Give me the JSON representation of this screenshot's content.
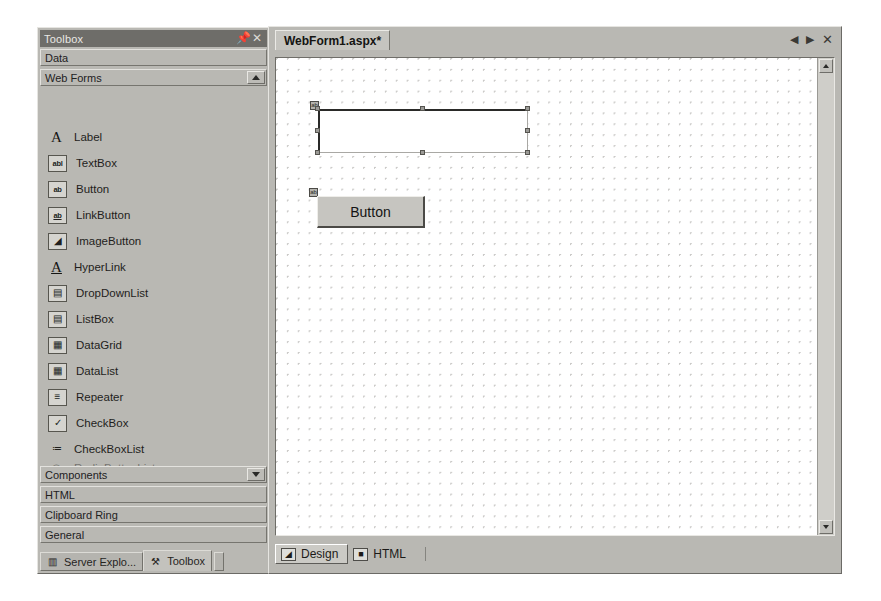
{
  "toolbox": {
    "title": "Toolbox",
    "pin_icon": "pin-icon",
    "close_icon": "close-icon",
    "categories_top": [
      {
        "label": "Data",
        "scroll": null
      },
      {
        "label": "Web Forms",
        "scroll": "up"
      }
    ],
    "items": [
      {
        "label": "Label",
        "icon": "label-icon",
        "glyph": "A"
      },
      {
        "label": "TextBox",
        "icon": "textbox-icon",
        "glyph": "abl"
      },
      {
        "label": "Button",
        "icon": "button-icon",
        "glyph": "ab"
      },
      {
        "label": "LinkButton",
        "icon": "linkbutton-icon",
        "glyph": "ab"
      },
      {
        "label": "ImageButton",
        "icon": "imagebutton-icon",
        "glyph": "◢"
      },
      {
        "label": "HyperLink",
        "icon": "hyperlink-icon",
        "glyph": "A"
      },
      {
        "label": "DropDownList",
        "icon": "dropdownlist-icon",
        "glyph": "▤"
      },
      {
        "label": "ListBox",
        "icon": "listbox-icon",
        "glyph": "▤"
      },
      {
        "label": "DataGrid",
        "icon": "datagrid-icon",
        "glyph": "▦"
      },
      {
        "label": "DataList",
        "icon": "datalist-icon",
        "glyph": "▦"
      },
      {
        "label": "Repeater",
        "icon": "repeater-icon",
        "glyph": "≡"
      },
      {
        "label": "CheckBox",
        "icon": "checkbox-icon",
        "glyph": "✓"
      },
      {
        "label": "CheckBoxList",
        "icon": "checkboxlist-icon",
        "glyph": "≔"
      }
    ],
    "item_partial": {
      "label": "RadioButtonList",
      "icon": "radiobuttonlist-icon",
      "glyph": "◎"
    },
    "categories_bottom": [
      {
        "label": "Components",
        "scroll": "down"
      },
      {
        "label": "HTML",
        "scroll": null
      },
      {
        "label": "Clipboard Ring",
        "scroll": null
      },
      {
        "label": "General",
        "scroll": null
      }
    ],
    "panel_tabs": [
      {
        "label": "Server Explo...",
        "icon": "server-explorer-icon",
        "glyph": "▥",
        "active": false
      },
      {
        "label": "Toolbox",
        "icon": "toolbox-icon",
        "glyph": "⚒",
        "active": true
      }
    ]
  },
  "editor": {
    "document_tab": "WebForm1.aspx*",
    "tab_buttons": [
      {
        "name": "nav-prev-button",
        "glyph": "◀"
      },
      {
        "name": "nav-next-button",
        "glyph": "▶"
      },
      {
        "name": "close-document-button",
        "glyph": "✕"
      }
    ],
    "scrollbar": {
      "up_glyph": "up-arrow-icon",
      "down_glyph": "down-arrow-icon"
    },
    "design_surface": {
      "controls": [
        {
          "type": "TextBox",
          "name": "textbox-control",
          "text": "",
          "selected": true,
          "tag_glyph": "ab"
        },
        {
          "type": "Button",
          "name": "button-control",
          "text": "Button",
          "selected": false,
          "tag_glyph": "ab"
        }
      ]
    },
    "view_tabs": [
      {
        "label": "Design",
        "icon": "design-view-icon",
        "glyph": "◢",
        "active": true
      },
      {
        "label": "HTML",
        "icon": "html-view-icon",
        "glyph": "■",
        "active": false
      }
    ]
  },
  "colors": {
    "panel_face": "#b9b8b3",
    "titlebar": "#6e6d69",
    "surface": "#ffffff",
    "text": "#1f1e1c",
    "grid_dot": "#c9c8c6"
  }
}
